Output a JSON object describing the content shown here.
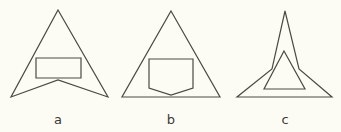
{
  "figure": {
    "background": "#fcfcf4",
    "stroke_color": "#4a4a44",
    "panels": [
      {
        "id": "a",
        "label": "a",
        "label_pos": [
          58,
          124
        ],
        "outer_shape": "concave arrowhead triangle",
        "outer_points": "58,10 108,97 58,80 11,97",
        "inner_shape": "rectangle",
        "inner_points": "36,58 81,58 81,78 36,78"
      },
      {
        "id": "b",
        "label": "b",
        "label_pos": [
          171,
          124
        ],
        "outer_shape": "triangle",
        "outer_points": "171,11 220,97 122,97",
        "inner_shape": "pentagon",
        "inner_points": "149,59 193,59 193,88 171,95 149,88"
      },
      {
        "id": "c",
        "label": "c",
        "label_pos": [
          285,
          124
        ],
        "outer_shape": "spire star",
        "outer_points": "285,11 299,69 332,97 237,97 272,69",
        "inner_shape": "triangle",
        "inner_points": "284,51 305,89 264,89"
      }
    ]
  }
}
